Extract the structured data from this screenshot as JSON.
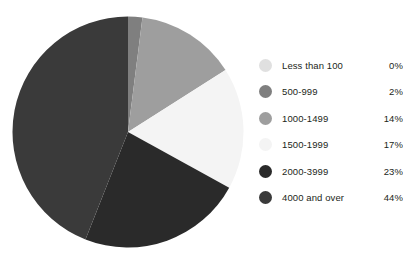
{
  "chart_data": {
    "type": "pie",
    "title": "",
    "subtitle": "",
    "xlabel": "",
    "ylabel": "",
    "grid": false,
    "legend_position": "right",
    "start_angle_deg": 0,
    "direction": "clockwise",
    "categories": [
      "Less than 100",
      "500-999",
      "1000-1499",
      "1500-1999",
      "2000-3999",
      "4000 and over"
    ],
    "values": [
      0,
      2,
      14,
      17,
      23,
      44
    ],
    "value_labels": [
      "0%",
      "2%",
      "14%",
      "17%",
      "23%",
      "44%"
    ],
    "units": "percent",
    "colors": [
      "#e0e0e0",
      "#7f7f7f",
      "#9e9e9e",
      "#f4f4f4",
      "#2a2a2a",
      "#3a3a3a"
    ]
  },
  "legend": {
    "items": [
      {
        "label": "Less than 100",
        "value": "0%",
        "color": "#e0e0e0"
      },
      {
        "label": "500-999",
        "value": "2%",
        "color": "#7f7f7f"
      },
      {
        "label": "1000-1499",
        "value": "14%",
        "color": "#9e9e9e"
      },
      {
        "label": "1500-1999",
        "value": "17%",
        "color": "#f4f4f4"
      },
      {
        "label": "2000-3999",
        "value": "23%",
        "color": "#2a2a2a"
      },
      {
        "label": "4000 and over",
        "value": "44%",
        "color": "#3a3a3a"
      }
    ]
  }
}
